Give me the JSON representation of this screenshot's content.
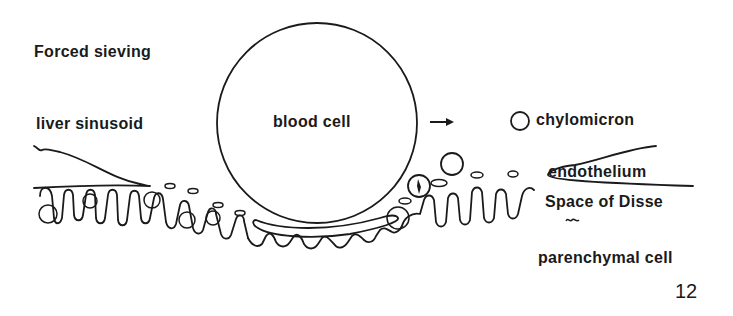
{
  "figure": {
    "title": "Forced sieving",
    "number": "12",
    "labels": {
      "liver_sinusoid": "liver sinusoid",
      "blood_cell": "blood cell",
      "chylomicron": "chylomicron",
      "endothelium": "endothelium",
      "space_of_disse": "Space of Disse",
      "parenchymal_cell": "parenchymal cell"
    },
    "arrow_direction": "right",
    "line_color": "#1a1a1a",
    "background": "#ffffff"
  }
}
